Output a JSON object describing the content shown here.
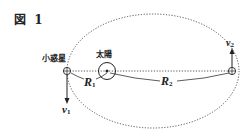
{
  "figure": {
    "title": "図 1",
    "labels": {
      "asteroid": "小惑星",
      "sun": "太陽",
      "r1_main": "R",
      "r1_sub": "1",
      "r2_main": "R",
      "r2_sub": "2",
      "v1_main": "v",
      "v1_sub": "1",
      "v2_main": "v",
      "v2_sub": "2"
    },
    "elements": {
      "orbit": "dotted-ellipse",
      "sun_symbol": "circle-with-center-dot",
      "asteroid_symbol": "circle-with-cross",
      "v1_direction": "down",
      "v2_direction": "up"
    },
    "colors": {
      "line": "#333333",
      "text": "#222222",
      "background": "#ffffff"
    }
  }
}
